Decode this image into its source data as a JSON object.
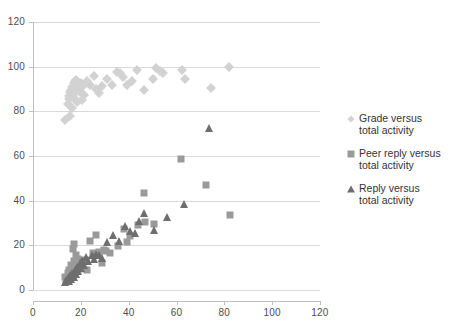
{
  "chart_data": {
    "type": "scatter",
    "title": "",
    "xlabel": "",
    "ylabel": "",
    "xlim": [
      0,
      120
    ],
    "ylim": [
      0,
      120
    ],
    "xticks": [
      0,
      20,
      40,
      60,
      80,
      100,
      120
    ],
    "yticks": [
      0,
      20,
      40,
      60,
      80,
      100,
      120
    ],
    "grid": "horizontal",
    "legend_position": "right",
    "colors": {
      "grade": "#d2d2d2",
      "peer_reply": "#9a9a9a",
      "reply": "#6e6e6e",
      "gridline": "#d9d9d9",
      "axis": "#bfbfbf",
      "tick_text": "#4d4d4d",
      "legend_text": "#333333"
    },
    "series": [
      {
        "name": "Grade versus total activity",
        "marker": "diamond",
        "color": "#d2d2d2",
        "points": [
          [
            13.5,
            76.0
          ],
          [
            15.5,
            78.0
          ],
          [
            14.5,
            83.5
          ],
          [
            16.5,
            81.5
          ],
          [
            17.0,
            86.0
          ],
          [
            15.0,
            87.0
          ],
          [
            15.5,
            88.5
          ],
          [
            16.0,
            89.5
          ],
          [
            16.5,
            91.0
          ],
          [
            17.0,
            92.5
          ],
          [
            17.5,
            93.5
          ],
          [
            18.0,
            91.5
          ],
          [
            18.5,
            90.0
          ],
          [
            17.5,
            88.0
          ],
          [
            16.0,
            86.5
          ],
          [
            15.0,
            85.5
          ],
          [
            18.0,
            94.0
          ],
          [
            19.0,
            93.0
          ],
          [
            20.0,
            92.5
          ],
          [
            21.0,
            91.5
          ],
          [
            19.5,
            88.5
          ],
          [
            21.5,
            87.5
          ],
          [
            20.5,
            85.0
          ],
          [
            18.5,
            84.0
          ],
          [
            22.5,
            93.5
          ],
          [
            24.0,
            92.0
          ],
          [
            25.5,
            96.0
          ],
          [
            26.5,
            90.0
          ],
          [
            27.5,
            88.0
          ],
          [
            29.0,
            91.5
          ],
          [
            31.0,
            94.5
          ],
          [
            33.0,
            92.0
          ],
          [
            35.0,
            97.5
          ],
          [
            36.5,
            97.0
          ],
          [
            37.5,
            95.5
          ],
          [
            39.5,
            92.0
          ],
          [
            41.5,
            93.5
          ],
          [
            43.5,
            98.5
          ],
          [
            46.5,
            89.5
          ],
          [
            51.5,
            99.5
          ],
          [
            53.0,
            98.0
          ],
          [
            54.5,
            97.0
          ],
          [
            62.5,
            98.5
          ],
          [
            63.5,
            94.5
          ],
          [
            74.5,
            90.5
          ],
          [
            82.0,
            100.0
          ],
          [
            50.0,
            94.5
          ]
        ]
      },
      {
        "name": "Peer reply versus total activity",
        "marker": "square",
        "color": "#9a9a9a",
        "points": [
          [
            13.5,
            6.0
          ],
          [
            14.0,
            5.0
          ],
          [
            14.5,
            7.5
          ],
          [
            15.0,
            9.0
          ],
          [
            15.5,
            6.5
          ],
          [
            16.0,
            11.0
          ],
          [
            16.5,
            8.0
          ],
          [
            17.0,
            13.0
          ],
          [
            17.5,
            10.5
          ],
          [
            18.0,
            15.5
          ],
          [
            18.5,
            12.0
          ],
          [
            16.8,
            18.5
          ],
          [
            17.2,
            20.5
          ],
          [
            19.0,
            14.0
          ],
          [
            19.5,
            9.5
          ],
          [
            20.5,
            11.5
          ],
          [
            22.0,
            13.5
          ],
          [
            22.5,
            9.0
          ],
          [
            24.0,
            22.0
          ],
          [
            25.0,
            16.5
          ],
          [
            26.5,
            24.5
          ],
          [
            27.5,
            17.0
          ],
          [
            29.5,
            18.0
          ],
          [
            30.5,
            17.5
          ],
          [
            32.0,
            16.5
          ],
          [
            35.5,
            19.5
          ],
          [
            38.0,
            27.5
          ],
          [
            39.5,
            21.5
          ],
          [
            40.5,
            24.0
          ],
          [
            44.0,
            29.0
          ],
          [
            46.5,
            43.5
          ],
          [
            47.0,
            30.5
          ],
          [
            50.5,
            29.5
          ],
          [
            62.0,
            58.5
          ],
          [
            72.5,
            47.0
          ],
          [
            82.5,
            33.5
          ],
          [
            29.0,
            12.0
          ]
        ]
      },
      {
        "name": "Reply versus total activity",
        "marker": "triangle",
        "color": "#6e6e6e",
        "points": [
          [
            13.5,
            3.5
          ],
          [
            14.0,
            4.5
          ],
          [
            14.5,
            5.5
          ],
          [
            15.0,
            4.0
          ],
          [
            15.5,
            6.5
          ],
          [
            16.0,
            5.0
          ],
          [
            16.5,
            7.5
          ],
          [
            17.0,
            6.0
          ],
          [
            17.5,
            9.0
          ],
          [
            18.0,
            7.0
          ],
          [
            18.5,
            10.5
          ],
          [
            19.0,
            8.5
          ],
          [
            19.5,
            12.0
          ],
          [
            20.0,
            10.0
          ],
          [
            20.5,
            13.5
          ],
          [
            21.5,
            11.0
          ],
          [
            22.0,
            15.0
          ],
          [
            23.0,
            13.0
          ],
          [
            24.5,
            15.5
          ],
          [
            25.5,
            14.0
          ],
          [
            26.5,
            16.0
          ],
          [
            27.5,
            15.5
          ],
          [
            29.0,
            14.5
          ],
          [
            31.0,
            21.5
          ],
          [
            33.5,
            24.5
          ],
          [
            36.0,
            22.0
          ],
          [
            38.5,
            28.5
          ],
          [
            40.5,
            26.5
          ],
          [
            42.5,
            25.5
          ],
          [
            44.5,
            31.0
          ],
          [
            46.5,
            34.5
          ],
          [
            50.5,
            27.0
          ],
          [
            56.0,
            32.5
          ],
          [
            63.0,
            38.5
          ],
          [
            73.5,
            72.5
          ]
        ]
      }
    ]
  },
  "legend": {
    "items": [
      {
        "label_line1": "Grade versus",
        "label_line2": "total activity",
        "marker": "diamond-marker"
      },
      {
        "label_line1": "Peer reply versus",
        "label_line2": "total activity",
        "marker": "square-marker"
      },
      {
        "label_line1": "Reply versus",
        "label_line2": "total activity",
        "marker": "triangle-marker"
      }
    ]
  },
  "axes": {
    "x_tick_labels": [
      "0",
      "20",
      "40",
      "60",
      "80",
      "100",
      "120"
    ],
    "y_tick_labels": [
      "0",
      "20",
      "40",
      "60",
      "80",
      "100",
      "120"
    ]
  }
}
